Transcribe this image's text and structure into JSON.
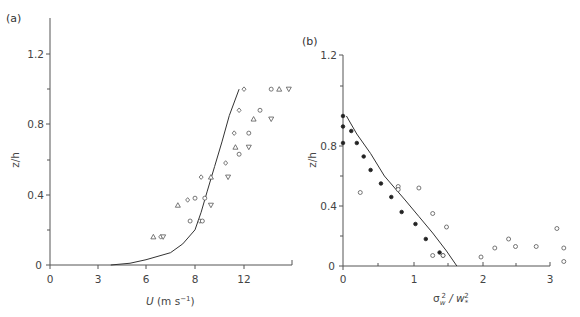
{
  "chart_data": [
    {
      "panel": "(a)",
      "type": "scatter",
      "xlabel": "U (m s⁻¹)",
      "ylabel": "z/h",
      "xticks": [
        "0",
        "3",
        "6",
        "8",
        "12",
        ""
      ],
      "yticks": [
        "0",
        "0.4",
        "0.8",
        "1.2"
      ],
      "ylim": [
        0,
        1.4
      ],
      "grid": false,
      "series": [
        {
          "name": "fit-curve",
          "type": "line",
          "points": [
            [
              3.8,
              0.0
            ],
            [
              5,
              0.01
            ],
            [
              6,
              0.03
            ],
            [
              7,
              0.07
            ],
            [
              7.5,
              0.12
            ],
            [
              8,
              0.2
            ],
            [
              8.5,
              0.3
            ],
            [
              9,
              0.42
            ],
            [
              9.6,
              0.56
            ],
            [
              10.2,
              0.7
            ],
            [
              10.8,
              0.85
            ],
            [
              11.6,
              1.0
            ]
          ]
        },
        {
          "name": "diamonds",
          "marker": "diamond",
          "points": [
            [
              12,
              1.0
            ],
            [
              11.6,
              0.88
            ],
            [
              11.2,
              0.75
            ],
            [
              10.5,
              0.58
            ],
            [
              8.5,
              0.5
            ],
            [
              7.7,
              0.37
            ],
            [
              6.6,
              0.16
            ],
            [
              8.4,
              0.25
            ]
          ]
        },
        {
          "name": "circles",
          "marker": "circle",
          "points": [
            [
              13.7,
              1.0
            ],
            [
              13,
              0.88
            ],
            [
              12.3,
              0.75
            ],
            [
              11.6,
              0.63
            ],
            [
              8,
              0.38
            ],
            [
              8.8,
              0.38
            ],
            [
              7.8,
              0.25
            ],
            [
              8.6,
              0.25
            ]
          ]
        },
        {
          "name": "triangles",
          "marker": "triangle",
          "points": [
            [
              14.2,
              1.0
            ],
            [
              12.6,
              0.83
            ],
            [
              11.3,
              0.67
            ],
            [
              9.3,
              0.5
            ],
            [
              7.3,
              0.34
            ],
            [
              6.3,
              0.16
            ]
          ]
        },
        {
          "name": "inverted-triangles",
          "marker": "triangle-down",
          "points": [
            [
              14.8,
              1.0
            ],
            [
              13.7,
              0.83
            ],
            [
              12.3,
              0.67
            ],
            [
              10.7,
              0.5
            ],
            [
              9.3,
              0.34
            ],
            [
              6.7,
              0.16
            ]
          ]
        }
      ]
    },
    {
      "panel": "(b)",
      "type": "scatter",
      "xlabel": "σ_w² / w_*²",
      "ylabel": "z/h",
      "xticks": [
        "0",
        "1",
        "2",
        "3"
      ],
      "yticks": [
        "0",
        "0.4",
        "0.8",
        "1.2"
      ],
      "ylim": [
        0,
        1.2
      ],
      "grid": false,
      "series": [
        {
          "name": "fit-curve",
          "type": "line",
          "points": [
            [
              0.05,
              1.0
            ],
            [
              0.2,
              0.88
            ],
            [
              0.4,
              0.75
            ],
            [
              0.6,
              0.6
            ],
            [
              0.9,
              0.44
            ],
            [
              1.1,
              0.33
            ],
            [
              1.3,
              0.22
            ],
            [
              1.5,
              0.1
            ],
            [
              1.65,
              0.0
            ]
          ]
        },
        {
          "name": "filled-circles",
          "marker": "filled-circle",
          "points": [
            [
              0,
              1.0
            ],
            [
              0,
              0.93
            ],
            [
              0,
              0.82
            ],
            [
              0.12,
              0.9
            ],
            [
              0.2,
              0.82
            ],
            [
              0.3,
              0.73
            ],
            [
              0.4,
              0.64
            ],
            [
              0.55,
              0.55
            ],
            [
              0.7,
              0.46
            ],
            [
              0.85,
              0.36
            ],
            [
              1.05,
              0.28
            ],
            [
              1.2,
              0.18
            ],
            [
              1.4,
              0.09
            ],
            [
              1.45,
              0.07
            ]
          ]
        },
        {
          "name": "open-circles",
          "marker": "circle",
          "points": [
            [
              0.25,
              0.49
            ],
            [
              0.8,
              0.53
            ],
            [
              0.8,
              0.51
            ],
            [
              1.1,
              0.52
            ],
            [
              1.3,
              0.35
            ],
            [
              1.5,
              0.26
            ],
            [
              1.3,
              0.07
            ],
            [
              1.45,
              0.07
            ],
            [
              2.0,
              0.06
            ],
            [
              2.2,
              0.12
            ],
            [
              2.4,
              0.18
            ],
            [
              2.5,
              0.13
            ],
            [
              2.8,
              0.13
            ],
            [
              3.1,
              0.25
            ],
            [
              3.2,
              0.12
            ],
            [
              3.2,
              0.03
            ]
          ]
        }
      ]
    }
  ],
  "panels": {
    "a": {
      "label": "(a)",
      "ylabel": "z/h",
      "xlabel_main": "U",
      "xlabel_unit": " (m s",
      "xlabel_exp": "−1",
      "xlabel_close": ")",
      "yticks": [
        "0",
        "0.4",
        "0.8",
        "1.2"
      ],
      "xticks": [
        "0",
        "3",
        "6",
        "8",
        "12"
      ]
    },
    "b": {
      "label": "(b)",
      "ylabel": "z/h",
      "xlabel_sigma": "σ",
      "xlabel_sub_w": "w",
      "xlabel_sup": "2",
      "xlabel_slash": " / w",
      "xlabel_sub_star": "*",
      "xlabel_sup2": "2",
      "yticks": [
        "0",
        "0.4",
        "0.8",
        "1.2"
      ],
      "xticks": [
        "0",
        "1",
        "2",
        "3"
      ]
    }
  }
}
